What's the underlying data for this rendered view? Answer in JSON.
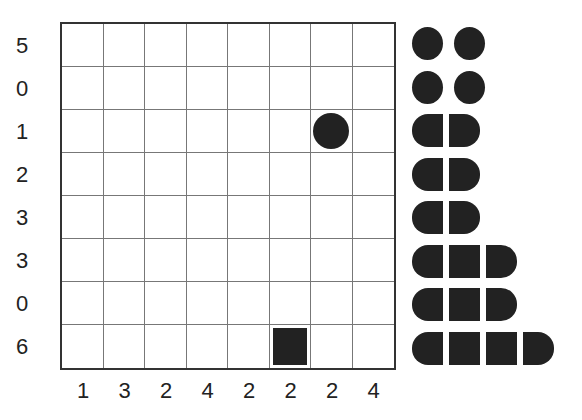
{
  "puzzle": {
    "type": "battleships",
    "size": 8,
    "row_clues": [
      "5",
      "0",
      "1",
      "2",
      "3",
      "3",
      "0",
      "6"
    ],
    "col_clues": [
      "1",
      "3",
      "2",
      "4",
      "2",
      "2",
      "2",
      "4"
    ],
    "given_cells": [
      {
        "row": 2,
        "col": 6,
        "shape": "circle"
      },
      {
        "row": 7,
        "col": 5,
        "shape": "square"
      }
    ]
  },
  "fleet": [
    {
      "length": 1
    },
    {
      "length": 1
    },
    {
      "length": 1
    },
    {
      "length": 1
    },
    {
      "length": 2
    },
    {
      "length": 2
    },
    {
      "length": 2
    },
    {
      "length": 3
    },
    {
      "length": 3
    },
    {
      "length": 4
    }
  ],
  "colors": {
    "ink": "#222222",
    "grid": "#777777",
    "border": "#333333"
  }
}
